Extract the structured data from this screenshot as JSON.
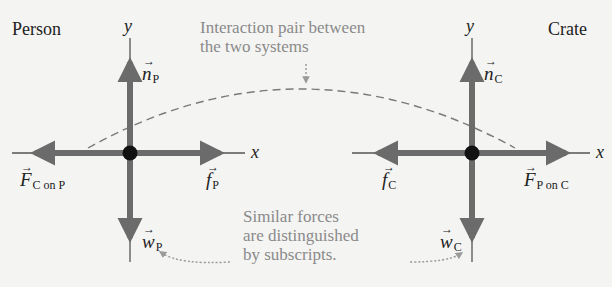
{
  "systems": {
    "person": {
      "label": "Person"
    },
    "crate": {
      "label": "Crate"
    }
  },
  "axes": {
    "x_label": "x",
    "y_label": "y"
  },
  "forces": {
    "person": {
      "normal": {
        "symbol": "n",
        "subscript": "P"
      },
      "weight": {
        "symbol": "w",
        "subscript": "P"
      },
      "friction": {
        "symbol": "f",
        "subscript": "P"
      },
      "interaction": {
        "symbol": "F",
        "subscript": "C on P"
      }
    },
    "crate": {
      "normal": {
        "symbol": "n",
        "subscript": "C"
      },
      "weight": {
        "symbol": "w",
        "subscript": "C"
      },
      "friction": {
        "symbol": "f",
        "subscript": "C"
      },
      "interaction": {
        "symbol": "F",
        "subscript": "P on C"
      }
    },
    "vector_arrow": "→"
  },
  "annotations": {
    "interaction_pair": {
      "line1": "Interaction pair between",
      "line2": "the two systems"
    },
    "subscripts": {
      "line1": "Similar forces",
      "line2": "are distinguished",
      "line3": "by subscripts."
    }
  },
  "colors": {
    "force_arrow": "#6b6b6b",
    "axis_line": "#555555",
    "dot": "#111111",
    "annotation_text": "#8a8a8a",
    "dashed_line": "#7a7a7a"
  }
}
